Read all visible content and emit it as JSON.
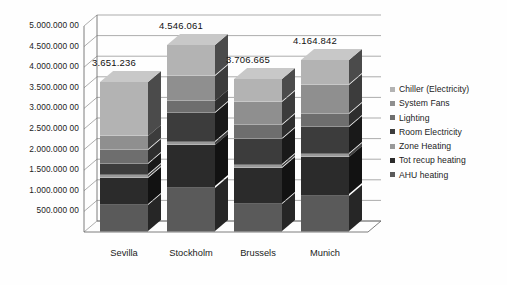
{
  "chart_data": {
    "type": "bar",
    "subtype": "stacked-column-3d",
    "title": "",
    "xlabel": "",
    "ylabel": "",
    "ylim": [
      0,
      5000000
    ],
    "ytick_step": 500000,
    "grid": true,
    "legend_position": "right",
    "categories": [
      "Sevilla",
      "Stockholm",
      "Brussels",
      "Munich"
    ],
    "ytick_labels": [
      "5.000.000 00",
      "4.500.000 00",
      "4.000.000 00",
      "3.500.000 00",
      "3.000.000 00",
      "2.500.000 00",
      "2.000.000 00",
      "1.500.000 00",
      "1.000.000 00",
      "500.000 00"
    ],
    "totals": [
      "3.651.236",
      "4.546.061",
      "3.706.665",
      "4.164.842"
    ],
    "total_values": [
      3651236,
      4546061,
      3706665,
      4164842
    ],
    "series": [
      {
        "name": "Chiller (Electricity)",
        "color": "#b3b3b3",
        "values": [
          1330000,
          750000,
          560000,
          600000
        ]
      },
      {
        "name": "System Fans",
        "color": "#8f8f8f",
        "values": [
          330000,
          620000,
          560000,
          700000
        ]
      },
      {
        "name": "Lighting",
        "color": "#6e6e6e",
        "values": [
          330000,
          280000,
          330000,
          320000
        ]
      },
      {
        "name": "Room Electricity",
        "color": "#3c3c3c",
        "values": [
          270000,
          700000,
          620000,
          650000
        ]
      },
      {
        "name": "Zone Heating",
        "color": "#9a9a9a",
        "values": [
          70000,
          90000,
          80000,
          85000
        ]
      },
      {
        "name": "Tot recup heating",
        "color": "#2b2b2b",
        "values": [
          660000,
          1030000,
          880000,
          930000
        ]
      },
      {
        "name": "AHU heating",
        "color": "#5a5a5a",
        "values": [
          661236,
          1076061,
          676665,
          879842
        ]
      }
    ]
  }
}
